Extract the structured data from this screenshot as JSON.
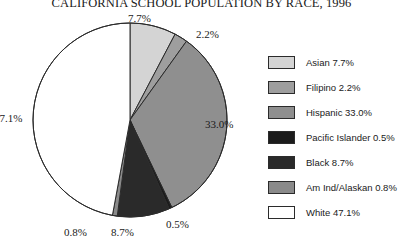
{
  "chart_data": {
    "type": "pie",
    "title": "CALIFORNIA SCHOOL POPULATION BY RACE, 1996",
    "xlabel": "",
    "ylabel": "",
    "legend_position": "right",
    "grid": false,
    "start_angle_deg": 0,
    "direction": "clockwise",
    "categories": [
      "Asian",
      "Filipino",
      "Hispanic",
      "Pacific Islander",
      "Black",
      "Am Ind/Alaskan",
      "White"
    ],
    "values": [
      7.7,
      2.2,
      33.0,
      0.5,
      8.7,
      0.8,
      47.1
    ],
    "value_labels": [
      "7.7%",
      "2.2%",
      "33.0%",
      "0.5%",
      "8.7%",
      "0.8%",
      "47.1%"
    ],
    "colors": [
      "#d4d4d4",
      "#9e9e9e",
      "#8f8f8f",
      "#1c1c1c",
      "#2a2a2a",
      "#8a8a8a",
      "#ffffff"
    ],
    "slices": [
      {
        "name": "Asian",
        "value": 7.7,
        "label": "Asian 7.7%",
        "value_label": "7.7%",
        "color": "#d4d4d4"
      },
      {
        "name": "Filipino",
        "value": 2.2,
        "label": "Filipino 2.2%",
        "value_label": "2.2%",
        "color": "#9e9e9e"
      },
      {
        "name": "Hispanic",
        "value": 33.0,
        "label": "Hispanic 33.0%",
        "value_label": "33.0%",
        "color": "#8f8f8f"
      },
      {
        "name": "Pacific Islander",
        "value": 0.5,
        "label": "Pacific Islander 0.5%",
        "value_label": "0.5%",
        "color": "#1c1c1c"
      },
      {
        "name": "Black",
        "value": 8.7,
        "label": "Black 8.7%",
        "value_label": "8.7%",
        "color": "#2a2a2a"
      },
      {
        "name": "Am Ind/Alaskan",
        "value": 0.8,
        "label": "Am Ind/Alaskan 0.8%",
        "value_label": "0.8%",
        "color": "#8a8a8a"
      },
      {
        "name": "White",
        "value": 47.1,
        "label": "White 47.1%",
        "value_label": "47.1%",
        "color": "#ffffff"
      }
    ]
  },
  "legend": {
    "items": [
      {
        "label": "Asian 7.7%"
      },
      {
        "label": "Filipino 2.2%"
      },
      {
        "label": "Hispanic 33.0%"
      },
      {
        "label": "Pacific Islander 0.5%"
      },
      {
        "label": "Black 8.7%"
      },
      {
        "label": "Am Ind/Alaskan 0.8%"
      },
      {
        "label": "White 47.1%"
      }
    ]
  },
  "outline_color": "#2b2b2b"
}
